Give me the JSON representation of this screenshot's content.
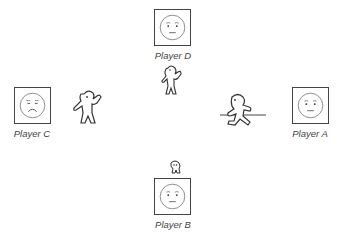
{
  "players": {
    "D": {
      "label": "Player D",
      "expression": "neutral"
    },
    "C": {
      "label": "Player C",
      "expression": "sad"
    },
    "A": {
      "label": "Player A",
      "expression": "neutral"
    },
    "B": {
      "label": "Player B",
      "expression": "neutral"
    }
  },
  "figures": {
    "D": "waving-figure",
    "C": "waving-figure",
    "A": "running-figure",
    "B": "small-figure"
  }
}
